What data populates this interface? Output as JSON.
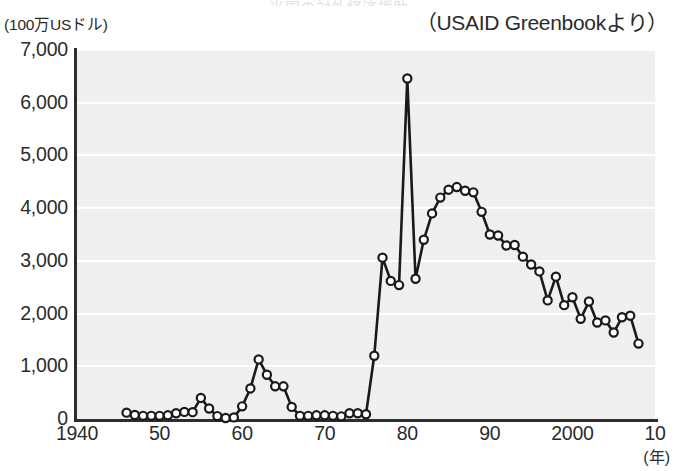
{
  "header": {
    "clipped_title": "米国の対外経済援助",
    "unit_label": "(100万USドル)",
    "source_label": "（USAID Greenbookより）"
  },
  "axes": {
    "y_ticks": [
      "7,000",
      "6,000",
      "5,000",
      "4,000",
      "3,000",
      "2,000",
      "1,000",
      "0"
    ],
    "x_ticks": [
      "1940",
      "50",
      "60",
      "70",
      "80",
      "90",
      "2000",
      "10"
    ],
    "x_unit": "(年)"
  },
  "style": {
    "line_color": "#1a1a1a",
    "marker_fill": "#ffffff",
    "marker_stroke": "#1a1a1a",
    "plot_background": "#ececec",
    "gridline_color": "#ffffff",
    "axis_color": "#2d2d2d"
  },
  "chart_data": {
    "type": "line",
    "title": "米国の対外経済援助",
    "subtitle": "（USAID Greenbookより）",
    "xlabel": "(年)",
    "ylabel": "(100万USドル)",
    "xlim": [
      1940,
      2010
    ],
    "ylim": [
      0,
      7000
    ],
    "grid": true,
    "legend": "none",
    "x_tick_values": [
      1940,
      1950,
      1960,
      1970,
      1980,
      1990,
      2000,
      2010
    ],
    "x_tick_labels": [
      "1940",
      "50",
      "60",
      "70",
      "80",
      "90",
      "2000",
      "10"
    ],
    "y_tick_values": [
      0,
      1000,
      2000,
      3000,
      4000,
      5000,
      6000,
      7000
    ],
    "y_tick_labels": [
      "0",
      "1,000",
      "2,000",
      "3,000",
      "4,000",
      "5,000",
      "6,000",
      "7,000"
    ],
    "series": [
      {
        "name": "米国の対日本向け経済援助",
        "marker": "circle-open",
        "x": [
          1946,
          1947,
          1948,
          1949,
          1950,
          1951,
          1952,
          1953,
          1954,
          1955,
          1956,
          1957,
          1958,
          1959,
          1960,
          1961,
          1962,
          1963,
          1964,
          1965,
          1966,
          1967,
          1968,
          1969,
          1970,
          1971,
          1972,
          1973,
          1974,
          1975,
          1976,
          1977,
          1978,
          1979,
          1980,
          1981,
          1982,
          1983,
          1984,
          1985,
          1986,
          1987,
          1988,
          1989,
          1990,
          1991,
          1992,
          1993,
          1994,
          1995,
          1996,
          1997,
          1998,
          1999,
          2000,
          2001,
          2002,
          2003,
          2004,
          2005,
          2006,
          2007,
          2008
        ],
        "values": [
          120,
          75,
          60,
          60,
          60,
          70,
          110,
          135,
          130,
          400,
          200,
          55,
          20,
          30,
          240,
          580,
          1130,
          840,
          620,
          620,
          230,
          60,
          60,
          70,
          70,
          60,
          50,
          110,
          110,
          90,
          1200,
          3060,
          2620,
          2540,
          6460,
          2660,
          3400,
          3900,
          4200,
          4350,
          4400,
          4330,
          4300,
          3930,
          3500,
          3480,
          3290,
          3300,
          3080,
          2930,
          2800,
          2250,
          2700,
          2160,
          2310,
          1900,
          2230,
          1830,
          1870,
          1640,
          1930,
          1960,
          1430
        ]
      }
    ]
  }
}
